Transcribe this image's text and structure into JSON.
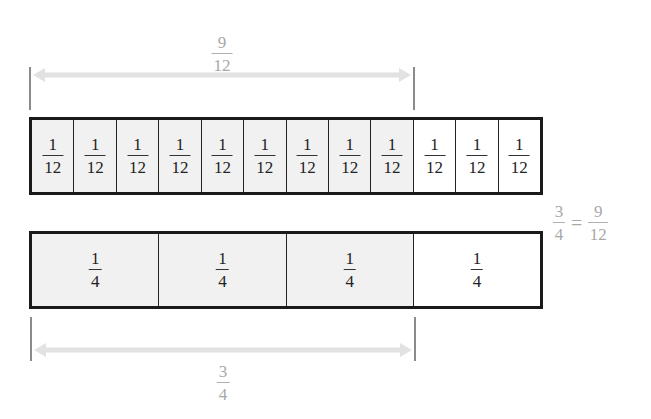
{
  "top_label": {
    "numerator": "9",
    "denominator": "12"
  },
  "bottom_label": {
    "numerator": "3",
    "denominator": "4"
  },
  "twelfths_strip": {
    "cells": [
      {
        "numerator": "1",
        "denominator": "12",
        "shaded": true
      },
      {
        "numerator": "1",
        "denominator": "12",
        "shaded": true
      },
      {
        "numerator": "1",
        "denominator": "12",
        "shaded": true
      },
      {
        "numerator": "1",
        "denominator": "12",
        "shaded": true
      },
      {
        "numerator": "1",
        "denominator": "12",
        "shaded": true
      },
      {
        "numerator": "1",
        "denominator": "12",
        "shaded": true
      },
      {
        "numerator": "1",
        "denominator": "12",
        "shaded": true
      },
      {
        "numerator": "1",
        "denominator": "12",
        "shaded": true
      },
      {
        "numerator": "1",
        "denominator": "12",
        "shaded": true
      },
      {
        "numerator": "1",
        "denominator": "12",
        "shaded": false
      },
      {
        "numerator": "1",
        "denominator": "12",
        "shaded": false
      },
      {
        "numerator": "1",
        "denominator": "12",
        "shaded": false
      }
    ]
  },
  "fourths_strip": {
    "cells": [
      {
        "numerator": "1",
        "denominator": "4",
        "shaded": true
      },
      {
        "numerator": "1",
        "denominator": "4",
        "shaded": true
      },
      {
        "numerator": "1",
        "denominator": "4",
        "shaded": true
      },
      {
        "numerator": "1",
        "denominator": "4",
        "shaded": false
      }
    ]
  },
  "equation": {
    "left": {
      "numerator": "3",
      "denominator": "4"
    },
    "sign": "=",
    "right": {
      "numerator": "9",
      "denominator": "12"
    }
  },
  "colors": {
    "shaded": "#f1f1f1",
    "unshaded": "#ffffff",
    "border": "#1a1a1a",
    "annotation": "#a8a8a8"
  }
}
